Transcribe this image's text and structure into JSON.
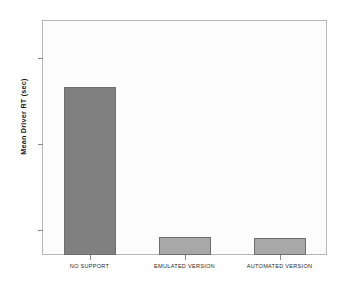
{
  "chart_data": {
    "type": "bar",
    "title": "",
    "subtitle": "",
    "xlabel": "",
    "ylabel": "Mean Driver RT (sec)",
    "categories": [
      "NO SUPPORT",
      "EMULATED VERSION",
      "AUTOMATED VERSION"
    ],
    "values": [
      1.366,
      1.193,
      1.192
    ],
    "ylim": [
      1.172,
      1.444
    ],
    "yticks": [
      1.2,
      1.3,
      1.4
    ],
    "ytick_labels": [
      "1.20",
      "1.30",
      "1.40"
    ],
    "bar_colors": [
      "#808080",
      "#a8a8a8",
      "#a8a8a8"
    ],
    "bar_border_color": "#6e6e6e",
    "grid": false,
    "legend": false,
    "legend_position": "none",
    "plot_background": "#fcfcfc",
    "frame_color": "#b7b7b7",
    "page_background": "#ffffff"
  },
  "axes": {
    "y_title": "Mean Driver RT (sec)",
    "ticks": [
      {
        "label": "1.40",
        "value": 1.4
      },
      {
        "label": "1.30",
        "value": 1.3
      },
      {
        "label": "1.20",
        "value": 1.2
      }
    ]
  },
  "bars": [
    {
      "label": "NO SUPPORT",
      "value": 1.366,
      "color": "#808080"
    },
    {
      "label": "EMULATED VERSION",
      "value": 1.193,
      "color": "#a8a8a8"
    },
    {
      "label": "AUTOMATED VERSION",
      "value": 1.192,
      "color": "#a8a8a8"
    }
  ]
}
